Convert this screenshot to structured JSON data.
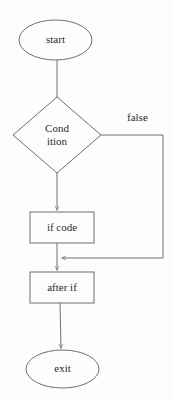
{
  "diagram": {
    "type": "flowchart",
    "colors": {
      "background": "#fdfdfd",
      "stroke": "#6e6e6e",
      "text": "#2b2b2b",
      "fill": "none"
    },
    "nodes": [
      {
        "id": "start",
        "shape": "ellipse",
        "label": "start",
        "cx": 55.5,
        "cy": 40,
        "rx": 36.5,
        "ry": 20
      },
      {
        "id": "condition",
        "shape": "diamond",
        "label_line1": "Cond",
        "label_line2": "ition",
        "cx": 57,
        "cy": 135,
        "halfwidth": 44,
        "halfheight": 38
      },
      {
        "id": "if-code",
        "shape": "rectangle",
        "label": "if code",
        "x": 30,
        "y": 212,
        "width": 64,
        "height": 31
      },
      {
        "id": "after-if",
        "shape": "rectangle",
        "label": "after if",
        "x": 30,
        "y": 272,
        "width": 64,
        "height": 31
      },
      {
        "id": "exit",
        "shape": "ellipse",
        "label": "exit",
        "cx": 62.5,
        "cy": 369,
        "rx": 36.5,
        "ry": 19
      }
    ],
    "edges": [
      {
        "id": "start-to-condition",
        "from": "start",
        "to": "condition",
        "label": "",
        "arrow": false
      },
      {
        "id": "condition-to-if-code",
        "from": "condition",
        "to": "if-code",
        "label": "",
        "arrow": true
      },
      {
        "id": "condition-false-branch",
        "from": "condition",
        "to": "merge-point",
        "label": "false",
        "arrow": true
      },
      {
        "id": "if-code-to-after-if",
        "from": "if-code",
        "to": "after-if",
        "label": "",
        "arrow": true
      },
      {
        "id": "after-if-to-exit",
        "from": "after-if",
        "to": "exit",
        "label": "",
        "arrow": true
      }
    ]
  }
}
